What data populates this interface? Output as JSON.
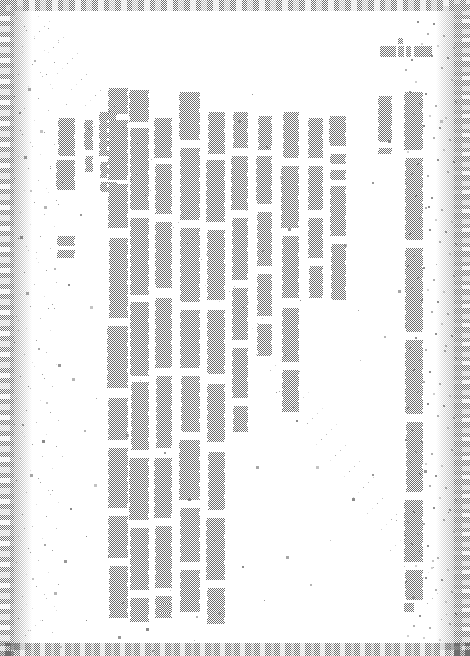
{
  "document": {
    "kind": "scanned-page",
    "title": "Degraded scanned page",
    "legibility": "illegible",
    "writing_mode": "vertical-rl",
    "page_width": 470,
    "page_height": 656,
    "background_color": "#ffffff",
    "ink_color": "#6e6e6e",
    "speckle_color": "#7a7a7a",
    "note": "Text is destroyed by scan degradation; no characters are readable."
  },
  "header": {
    "name": "header-ink-block",
    "text": "",
    "legible": false,
    "x": 380,
    "y": 46,
    "width": 52,
    "height": 11,
    "segments": [
      {
        "x": 0,
        "w": 16
      },
      {
        "x": 18,
        "w": 6
      },
      {
        "x": 26,
        "w": 5
      },
      {
        "x": 34,
        "w": 18
      }
    ],
    "tick": {
      "x": 398,
      "y": 38,
      "w": 5,
      "h": 6
    }
  },
  "frame": {
    "name": "scan-border-frame",
    "edges": [
      "left",
      "right",
      "top",
      "bottom"
    ]
  },
  "columns": [
    {
      "id": "col-1",
      "x": 57,
      "y": 118,
      "w": 18,
      "top_indent": 0,
      "segments": [
        [
          0,
          38
        ],
        [
          42,
          72
        ],
        [
          118,
          128
        ],
        [
          132,
          140
        ]
      ]
    },
    {
      "id": "col-2",
      "x": 85,
      "y": 120,
      "w": 8,
      "top_indent": 0,
      "segments": [
        [
          0,
          30
        ],
        [
          36,
          52
        ]
      ]
    },
    {
      "id": "col-3",
      "x": 100,
      "y": 112,
      "w": 17,
      "top_indent": 0,
      "segments": [
        [
          0,
          44
        ],
        [
          50,
          66
        ],
        [
          70,
          80
        ]
      ]
    },
    {
      "id": "col-4",
      "x": 108,
      "y": 88,
      "w": 20,
      "top_indent": 0,
      "segments": [
        [
          0,
          26
        ],
        [
          32,
          92
        ],
        [
          96,
          140
        ],
        [
          150,
          230
        ],
        [
          238,
          300
        ],
        [
          310,
          352
        ],
        [
          360,
          420
        ],
        [
          428,
          470
        ],
        [
          478,
          530
        ]
      ]
    },
    {
      "id": "col-5",
      "x": 130,
      "y": 90,
      "w": 19,
      "top_indent": 0,
      "segments": [
        [
          0,
          32
        ],
        [
          38,
          120
        ],
        [
          128,
          205
        ],
        [
          212,
          286
        ],
        [
          292,
          360
        ],
        [
          368,
          430
        ],
        [
          438,
          500
        ],
        [
          508,
          532
        ]
      ]
    },
    {
      "id": "col-6",
      "x": 155,
      "y": 118,
      "w": 17,
      "top_indent": 0,
      "segments": [
        [
          0,
          40
        ],
        [
          46,
          96
        ],
        [
          104,
          170
        ],
        [
          180,
          250
        ],
        [
          258,
          330
        ],
        [
          340,
          400
        ],
        [
          408,
          470
        ],
        [
          478,
          500
        ]
      ]
    },
    {
      "id": "col-7",
      "x": 180,
      "y": 92,
      "w": 20,
      "top_indent": 0,
      "segments": [
        [
          0,
          48
        ],
        [
          56,
          128
        ],
        [
          136,
          210
        ],
        [
          218,
          276
        ],
        [
          284,
          340
        ],
        [
          348,
          408
        ],
        [
          416,
          470
        ],
        [
          478,
          520
        ]
      ]
    },
    {
      "id": "col-8",
      "x": 207,
      "y": 112,
      "w": 18,
      "top_indent": 0,
      "segments": [
        [
          0,
          42
        ],
        [
          48,
          110
        ],
        [
          118,
          188
        ],
        [
          198,
          262
        ],
        [
          272,
          330
        ],
        [
          340,
          398
        ],
        [
          406,
          468
        ],
        [
          476,
          512
        ]
      ]
    },
    {
      "id": "col-9",
      "x": 232,
      "y": 112,
      "w": 16,
      "top_indent": 0,
      "segments": [
        [
          0,
          36
        ],
        [
          44,
          98
        ],
        [
          106,
          168
        ],
        [
          176,
          228
        ],
        [
          236,
          286
        ],
        [
          294,
          320
        ]
      ]
    },
    {
      "id": "col-10",
      "x": 257,
      "y": 116,
      "w": 15,
      "top_indent": 0,
      "segments": [
        [
          0,
          34
        ],
        [
          40,
          88
        ],
        [
          96,
          150
        ],
        [
          158,
          200
        ],
        [
          208,
          240
        ]
      ]
    },
    {
      "id": "col-11",
      "x": 282,
      "y": 112,
      "w": 17,
      "top_indent": 0,
      "segments": [
        [
          0,
          46
        ],
        [
          54,
          116
        ],
        [
          124,
          186
        ],
        [
          196,
          250
        ],
        [
          258,
          300
        ]
      ]
    },
    {
      "id": "col-12",
      "x": 308,
      "y": 118,
      "w": 15,
      "top_indent": 0,
      "segments": [
        [
          0,
          40
        ],
        [
          48,
          92
        ],
        [
          100,
          140
        ],
        [
          148,
          180
        ]
      ]
    },
    {
      "id": "col-13",
      "x": 330,
      "y": 116,
      "w": 16,
      "top_indent": 0,
      "segments": [
        [
          0,
          30
        ],
        [
          38,
          48
        ],
        [
          54,
          64
        ],
        [
          70,
          120
        ],
        [
          128,
          184
        ]
      ]
    },
    {
      "id": "col-14",
      "x": 378,
      "y": 96,
      "w": 14,
      "top_indent": 0,
      "segments": [
        [
          0,
          46
        ],
        [
          52,
          58
        ]
      ]
    },
    {
      "id": "col-15",
      "x": 405,
      "y": 92,
      "w": 18,
      "top_indent": 0,
      "segments": [
        [
          0,
          58
        ],
        [
          66,
          148
        ],
        [
          156,
          240
        ],
        [
          248,
          322
        ],
        [
          330,
          400
        ],
        [
          408,
          470
        ],
        [
          478,
          508
        ]
      ]
    }
  ],
  "footer_marks": [
    {
      "x": 134,
      "y": 604,
      "w": 12,
      "h": 9
    },
    {
      "x": 160,
      "y": 604,
      "w": 10,
      "h": 9
    },
    {
      "x": 180,
      "y": 604,
      "w": 5,
      "h": 6
    },
    {
      "x": 208,
      "y": 605,
      "w": 12,
      "h": 8
    },
    {
      "x": 404,
      "y": 603,
      "w": 10,
      "h": 9
    }
  ],
  "speckles": [
    [
      22,
      46
    ],
    [
      34,
      60
    ],
    [
      28,
      88
    ],
    [
      46,
      74
    ],
    [
      19,
      112
    ],
    [
      40,
      130
    ],
    [
      66,
      104
    ],
    [
      88,
      128
    ],
    [
      24,
      156
    ],
    [
      50,
      168
    ],
    [
      30,
      190
    ],
    [
      44,
      206
    ],
    [
      62,
      182
    ],
    [
      80,
      214
    ],
    [
      20,
      236
    ],
    [
      36,
      252
    ],
    [
      54,
      268
    ],
    [
      26,
      292
    ],
    [
      48,
      308
    ],
    [
      68,
      284
    ],
    [
      90,
      306
    ],
    [
      18,
      330
    ],
    [
      38,
      348
    ],
    [
      58,
      364
    ],
    [
      28,
      386
    ],
    [
      46,
      402
    ],
    [
      72,
      378
    ],
    [
      96,
      398
    ],
    [
      22,
      424
    ],
    [
      42,
      440
    ],
    [
      62,
      456
    ],
    [
      84,
      430
    ],
    [
      30,
      474
    ],
    [
      52,
      490
    ],
    [
      70,
      508
    ],
    [
      94,
      484
    ],
    [
      24,
      528
    ],
    [
      44,
      544
    ],
    [
      64,
      560
    ],
    [
      86,
      536
    ],
    [
      32,
      578
    ],
    [
      54,
      592
    ],
    [
      108,
      556
    ],
    [
      122,
      602
    ],
    [
      146,
      628
    ],
    [
      170,
      590
    ],
    [
      196,
      616
    ],
    [
      238,
      120
    ],
    [
      252,
      94
    ],
    [
      266,
      146
    ],
    [
      280,
      176
    ],
    [
      246,
      210
    ],
    [
      262,
      250
    ],
    [
      288,
      228
    ],
    [
      300,
      300
    ],
    [
      320,
      268
    ],
    [
      344,
      244
    ],
    [
      358,
      310
    ],
    [
      372,
      182
    ],
    [
      388,
      140
    ],
    [
      360,
      360
    ],
    [
      384,
      336
    ],
    [
      398,
      290
    ],
    [
      412,
      430
    ],
    [
      428,
      206
    ],
    [
      440,
      120
    ],
    [
      436,
      264
    ],
    [
      444,
      350
    ],
    [
      424,
      470
    ],
    [
      448,
      512
    ],
    [
      432,
      560
    ],
    [
      412,
      596
    ],
    [
      396,
      520
    ],
    [
      372,
      474
    ],
    [
      352,
      498
    ],
    [
      330,
      540
    ],
    [
      310,
      584
    ],
    [
      286,
      556
    ],
    [
      264,
      600
    ],
    [
      242,
      566
    ],
    [
      218,
      612
    ],
    [
      194,
      640
    ],
    [
      152,
      650
    ],
    [
      118,
      636
    ],
    [
      86,
      620
    ],
    [
      60,
      646
    ],
    [
      126,
      434
    ],
    [
      140,
      380
    ],
    [
      164,
      452
    ],
    [
      188,
      498
    ],
    [
      214,
      540
    ],
    [
      236,
      430
    ],
    [
      256,
      466
    ],
    [
      276,
      392
    ],
    [
      296,
      420
    ],
    [
      316,
      466
    ]
  ]
}
